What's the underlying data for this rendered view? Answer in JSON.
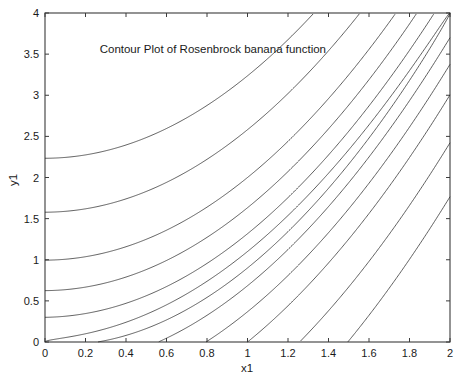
{
  "figure": {
    "background_color": "#ffffff",
    "axes_color": "#3b3b3b",
    "contour_color": "#2a2a2a"
  },
  "chart_data": {
    "type": "line",
    "title": "Contour Plot of Rosenbrock banana function",
    "xlabel": "x1",
    "ylabel": "y1",
    "xlim": [
      0,
      2
    ],
    "ylim": [
      0,
      4
    ],
    "grid": false,
    "legend": "none",
    "x_ticks": [
      0,
      0.2,
      0.4,
      0.6,
      0.8,
      1,
      1.2,
      1.4,
      1.6,
      1.8,
      2
    ],
    "x_tick_labels": [
      "0",
      "0.2",
      "0.4",
      "0.6",
      "0.8",
      "1",
      "1.2",
      "1.4",
      "1.6",
      "1.8",
      "2"
    ],
    "y_ticks": [
      0,
      0.5,
      1,
      1.5,
      2,
      2.5,
      3,
      3.5,
      4
    ],
    "y_tick_labels": [
      "0",
      "0.5",
      "1",
      "1.5",
      "2",
      "2.5",
      "3",
      "3.5",
      "4"
    ],
    "function": "f(x1,y1) = 100*(y1 - x1^2)^2 + (1 - x1)^2",
    "contour_levels": [
      1,
      10,
      40,
      100,
      250,
      500
    ],
    "minimum": {
      "x1": 1,
      "y1": 1,
      "value": 0
    },
    "series": [
      {
        "name": "level-1",
        "level": 1
      },
      {
        "name": "level-10",
        "level": 10
      },
      {
        "name": "level-40",
        "level": 40
      },
      {
        "name": "level-100",
        "level": 100
      },
      {
        "name": "level-250",
        "level": 250
      },
      {
        "name": "level-500",
        "level": 500
      }
    ],
    "annotations": [
      {
        "text": "Contour Plot of Rosenbrock banana function",
        "x1": 0.27,
        "y1": 3.52
      }
    ]
  },
  "title_block": {
    "text": "Contour Plot of Rosenbrock banana function"
  }
}
